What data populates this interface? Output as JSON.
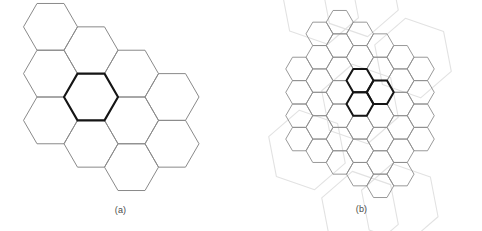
{
  "figure": {
    "background_color": "#ffffff",
    "width": 482,
    "height": 231
  },
  "panels": [
    {
      "id": "panel-a",
      "caption": "(a)",
      "description": "Single-cell hexagonal cluster: one highlighted central hexagon surrounded by neighbouring cells",
      "orientation": "flat-top",
      "cell_width": 54,
      "cell_height": 54,
      "stroke_normal": "#8a8a8a",
      "stroke_highlight": "#151515",
      "stroke_width_normal": 1,
      "stroke_width_highlight": 2.1,
      "center": {
        "x": 91,
        "y": 97
      },
      "highlight_cells": [
        [
          0,
          0
        ]
      ],
      "cells": [
        [
          0,
          0
        ],
        [
          1,
          -1
        ],
        [
          1,
          0
        ],
        [
          0,
          -1
        ],
        [
          -1,
          0
        ],
        [
          -1,
          1
        ],
        [
          0,
          1
        ],
        [
          2,
          -1
        ],
        [
          2,
          0
        ],
        [
          1,
          1
        ],
        [
          -1,
          -1
        ]
      ]
    },
    {
      "id": "panel-b",
      "caption": "(b)",
      "description": "Three-cell cluster highlighted inside a finer hexagonal grid, with faint large super-hexagons overlaid",
      "orientation": "flat-top",
      "cell_width": 27,
      "cell_height": 27,
      "stroke_normal": "#8d8d8d",
      "stroke_highlight": "#151515",
      "stroke_faint": "#e2e2e2",
      "stroke_width_normal": 0.9,
      "stroke_width_highlight": 2.0,
      "stroke_width_faint": 1.1,
      "center": {
        "x": 119,
        "y": 104
      },
      "grid_radius": 3,
      "highlight_cells": [
        [
          0,
          -1
        ],
        [
          0,
          0
        ],
        [
          1,
          -1
        ]
      ],
      "supercell_scale": 3,
      "supercell_centers": [
        [
          0,
          0
        ],
        [
          1,
          -2
        ],
        [
          2,
          1
        ],
        [
          1,
          2
        ],
        [
          -1,
          2
        ],
        [
          -2,
          -1
        ],
        [
          -1,
          -2
        ]
      ]
    }
  ],
  "colors": {
    "ink": "#151515",
    "grid": "#8a8a8a",
    "faint": "#e2e2e2",
    "caption": "#4a4a4a",
    "background": "#ffffff"
  }
}
